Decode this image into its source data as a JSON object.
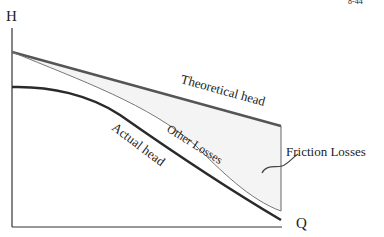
{
  "diagram": {
    "type": "pump characteristic curve",
    "axes": {
      "y_label": "H",
      "x_label": "Q"
    },
    "curves": {
      "theoretical": {
        "label": "Theoretical head",
        "color": "#555555"
      },
      "other_losses": {
        "label": "Other Losses",
        "color": "#777777"
      },
      "actual": {
        "label": "Actual head",
        "color": "#2a2a2a"
      }
    },
    "regions": {
      "friction": {
        "label": "Friction Losses",
        "fill": "#f6f6f6"
      }
    },
    "corner_fragment": "8-44"
  }
}
